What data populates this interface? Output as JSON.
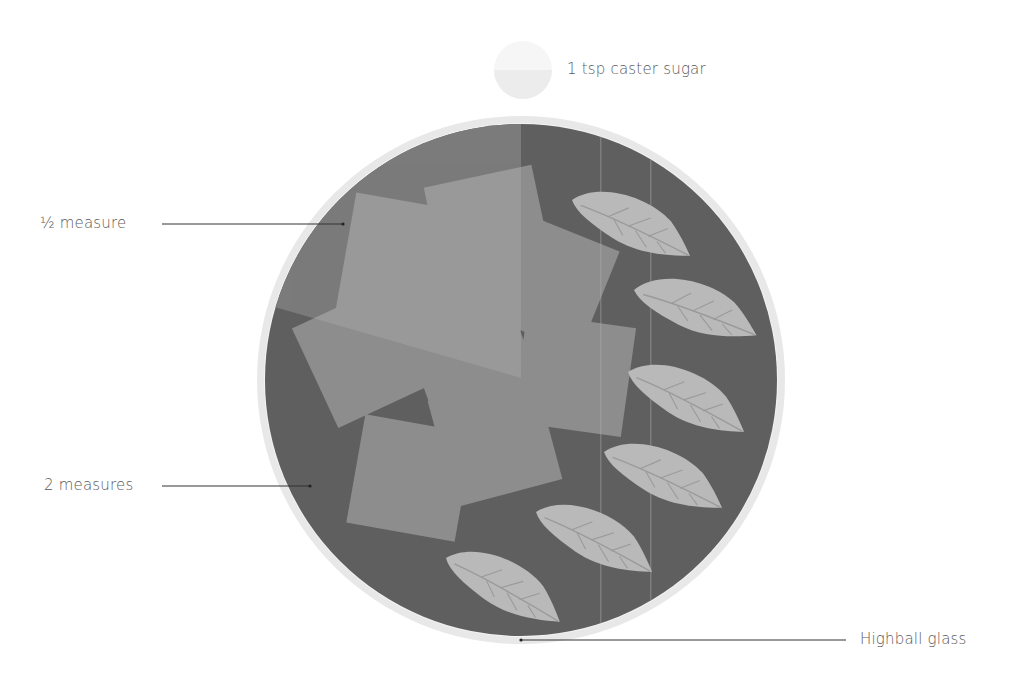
{
  "diagram": {
    "labels": {
      "sugar": "1 tsp caster sugar",
      "half_measure": "½ measure",
      "two_measures": "2 measures",
      "glass": "Highball glass"
    },
    "elements": {
      "sugar_icon": "sugar-spoon-icon",
      "glass": "highball-glass-top-view",
      "ice_cube_count": 8,
      "mint_leaf_count": 8
    },
    "colors": {
      "background": "#ffffff",
      "glass_rim": "#e6e6e6",
      "liquid_dark": "#5f5f5f",
      "liquid_light": "#7d7d7d",
      "ice": "#a8a8a8",
      "mint_leaf": "#b9b9b9",
      "leader_line": "#333333",
      "label_text": "#5a5a5a"
    }
  }
}
